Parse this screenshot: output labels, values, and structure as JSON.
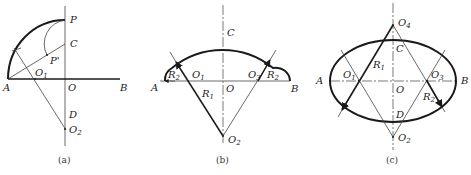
{
  "figure": {
    "panels": [
      {
        "id": "a",
        "caption": "(a)",
        "labels": {
          "P": "P",
          "C": "C",
          "P_prime": "P'",
          "O1": "O",
          "O1_sub": "1",
          "A": "A",
          "O": "O",
          "B": "B",
          "D": "D",
          "O2": "O",
          "O2_sub": "2"
        }
      },
      {
        "id": "b",
        "caption": "(b)",
        "labels": {
          "C": "C",
          "A": "A",
          "R2_left": "R",
          "R2_left_sub": "2",
          "O1": "O",
          "O1_sub": "1",
          "O": "O",
          "O3": "O",
          "O3_sub": "3",
          "R2_right": "R",
          "R2_right_sub": "2",
          "B": "B",
          "R1": "R",
          "R1_sub": "1",
          "O2": "O",
          "O2_sub": "2"
        }
      },
      {
        "id": "c",
        "caption": "(c)",
        "labels": {
          "O4": "O",
          "O4_sub": "4",
          "C": "C",
          "R1": "R",
          "R1_sub": "1",
          "A": "A",
          "O1": "O",
          "O1_sub": "1",
          "O": "O",
          "O3": "O",
          "O3_sub": "3",
          "B": "B",
          "R2": "R",
          "R2_sub": "2",
          "D": "D",
          "O2": "O",
          "O2_sub": "2"
        }
      }
    ]
  },
  "colors": {
    "stroke": "#1a1a1a",
    "thin_stroke": "#444444",
    "background": "#ffffff"
  }
}
